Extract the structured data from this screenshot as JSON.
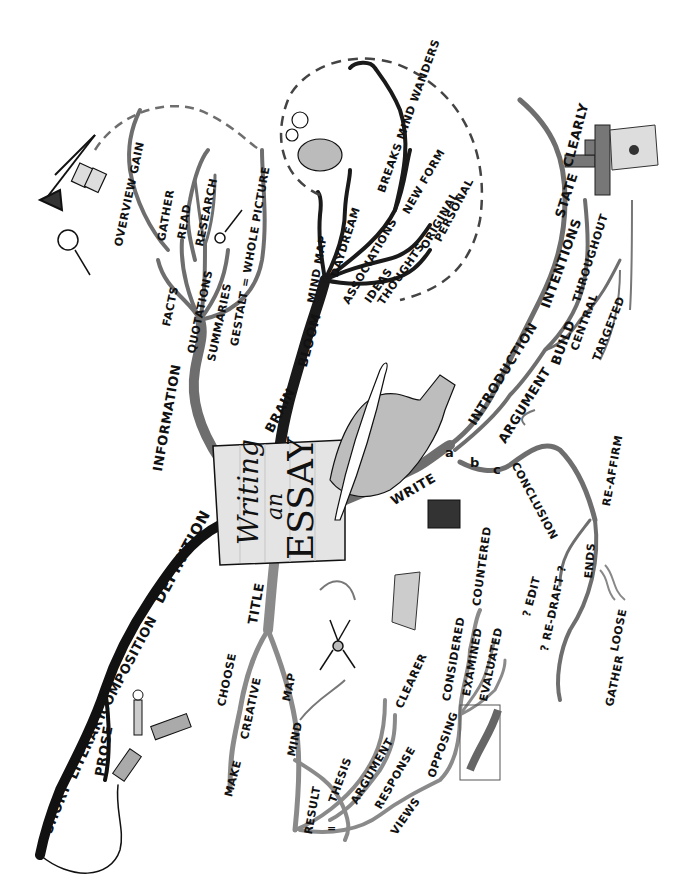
{
  "title": {
    "line1": "Writing",
    "line2": "an",
    "line3": "ESSAY"
  },
  "branches": {
    "definition": {
      "main": "DEFINITION",
      "words": [
        "COMPOSITION",
        "LITERARY",
        "SHORT",
        "PROSE"
      ]
    },
    "information": {
      "main": "INFORMATION",
      "sub": [
        "FACTS",
        "QUOTATIONS",
        "SUMMARIES",
        "GESTALT = WHOLE PICTURE"
      ],
      "research": [
        "GATHER",
        "READ",
        "RESEARCH"
      ],
      "overview": "OVERVIEW GAIN"
    },
    "brain": {
      "main": "BRAIN",
      "bloom": "BLOOM",
      "mindmap": "MIND MAP",
      "daydream": "DAYDREAM",
      "breaks": "BREAKS MIND WANDERS",
      "associations": "ASSOCIATIONS",
      "ideas": "IDEAS",
      "thoughts": "THOUGHTS",
      "newform": "NEW FORM",
      "original": "ORIGINAL",
      "personal": "PERSONAL"
    },
    "write": {
      "main": "WRITE",
      "a": "a",
      "b": "b",
      "c": "c",
      "introduction": "INTRODUCTION",
      "intentions": "INTENTIONS",
      "state": "STATE",
      "clearly": "CLEARLY",
      "argument": "ARGUMENT",
      "build": "BUILD",
      "throughout": "THROUGHOUT",
      "central": "CENTRAL",
      "targeted": "TARGETED",
      "conclusion": "CONCLUSION",
      "reaffirm": "RE-AFFIRM",
      "ends": "ENDS",
      "gather": "GATHER",
      "loose": "LOOSE",
      "edit": "? EDIT",
      "redraft": "? RE-DRAFT ?"
    },
    "title_branch": {
      "main": "TITLE",
      "choose": "CHOOSE",
      "creative": "CREATIVE",
      "make": "MAKE",
      "map": "MAP",
      "mind": "MIND",
      "result": "RESULT",
      "equals": "=",
      "thesis": "THESIS",
      "argument": "ARGUMENT",
      "response": "RESPONSE",
      "views": "VIEWS",
      "clearer": "CLEARER",
      "opposing": "OPPOSING",
      "considered": "CONSIDERED",
      "examined": "EXAMINED",
      "evaluated": "EVALUATED",
      "countered": "COUNTERED"
    }
  },
  "illustrations": [
    "telescope-icon",
    "binoculars-icon",
    "magnifier-icon",
    "key-icon",
    "brain-walking-icon",
    "thought-clouds-icon",
    "quill-hand-icon",
    "brick-stairs-icon",
    "target-book-icon",
    "saw-icon",
    "pencil-icon",
    "neuron-icon",
    "geometry-card-icon",
    "spool-icon",
    "arm-wrestle-icon"
  ],
  "colors": {
    "ink": "#111111",
    "branch_dark": "#1a1a1a",
    "branch_mid": "#6e6e6e",
    "branch_light": "#9a9a9a",
    "paper": "#e4e4e4",
    "hand": "#bdbdbd"
  }
}
